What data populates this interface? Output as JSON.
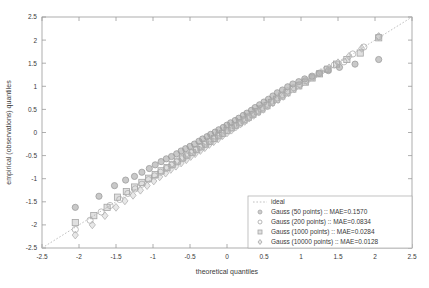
{
  "chart_data": {
    "type": "scatter",
    "title": "",
    "xlabel": "theoretical quantiles",
    "ylabel": "empirical (observations) quantiles",
    "xlim": [
      -2.5,
      2.5
    ],
    "ylim": [
      -2.5,
      2.5
    ],
    "xticks": [
      "-2.5",
      "-2",
      "-1.5",
      "-1",
      "-0.5",
      "0",
      "0.5",
      "1",
      "1.5",
      "2",
      "2.5"
    ],
    "yticks": [
      "-2.5",
      "-2",
      "-1.5",
      "-1",
      "-0.5",
      "0",
      "0.5",
      "1",
      "1.5",
      "2",
      "2.5"
    ],
    "xtick_values": [
      -2.5,
      -2,
      -1.5,
      -1,
      -0.5,
      0,
      0.5,
      1,
      1.5,
      2,
      2.5
    ],
    "ytick_values": [
      -2.5,
      -2,
      -1.5,
      -1,
      -0.5,
      0,
      0.5,
      1,
      1.5,
      2,
      2.5
    ],
    "grid": false,
    "legend_position": "lower-right",
    "reference_line": {
      "name": "ideal",
      "style": "dotted",
      "color": "#b9b9b9",
      "from": [
        -2.5,
        -2.5
      ],
      "to": [
        2.5,
        2.5
      ]
    },
    "series": [
      {
        "name": "Gauss (50 points) :: MAE=0.1570",
        "label": "Gauss (50 points)",
        "mae": "0.1570",
        "marker": "circle",
        "color": "#9d9d9d",
        "points": [
          [
            -2.05,
            -1.62
          ],
          [
            -1.73,
            -1.38
          ],
          [
            -1.52,
            -1.15
          ],
          [
            -1.37,
            -1.03
          ],
          [
            -1.25,
            -0.95
          ],
          [
            -1.15,
            -0.86
          ],
          [
            -1.05,
            -0.78
          ],
          [
            -0.97,
            -0.7
          ],
          [
            -0.89,
            -0.63
          ],
          [
            -0.82,
            -0.57
          ],
          [
            -0.75,
            -0.52
          ],
          [
            -0.68,
            -0.46
          ],
          [
            -0.62,
            -0.4
          ],
          [
            -0.56,
            -0.35
          ],
          [
            -0.5,
            -0.3
          ],
          [
            -0.44,
            -0.25
          ],
          [
            -0.38,
            -0.19
          ],
          [
            -0.33,
            -0.14
          ],
          [
            -0.27,
            -0.09
          ],
          [
            -0.22,
            -0.04
          ],
          [
            -0.16,
            0.01
          ],
          [
            -0.11,
            0.06
          ],
          [
            -0.05,
            0.11
          ],
          [
            0.0,
            0.16
          ],
          [
            0.05,
            0.21
          ],
          [
            0.11,
            0.26
          ],
          [
            0.16,
            0.31
          ],
          [
            0.22,
            0.37
          ],
          [
            0.27,
            0.42
          ],
          [
            0.33,
            0.48
          ],
          [
            0.38,
            0.54
          ],
          [
            0.44,
            0.6
          ],
          [
            0.5,
            0.66
          ],
          [
            0.56,
            0.72
          ],
          [
            0.62,
            0.79
          ],
          [
            0.68,
            0.86
          ],
          [
            0.75,
            0.92
          ],
          [
            0.82,
            0.99
          ],
          [
            0.89,
            1.05
          ],
          [
            0.97,
            1.1
          ],
          [
            1.05,
            1.16
          ],
          [
            1.15,
            1.22
          ],
          [
            1.25,
            1.28
          ],
          [
            1.37,
            1.34
          ],
          [
            1.52,
            1.41
          ],
          [
            1.73,
            1.48
          ],
          [
            2.05,
            1.58
          ]
        ]
      },
      {
        "name": "Gauss (200 points) :: MAE=0.0834",
        "label": "Gauss (200 points)",
        "mae": "0.0834",
        "marker": "circle-open",
        "color": "#aeaeae",
        "points": [
          [
            -2.05,
            -2.1
          ],
          [
            -1.85,
            -1.9
          ],
          [
            -1.7,
            -1.72
          ],
          [
            -1.58,
            -1.58
          ],
          [
            -1.45,
            -1.45
          ],
          [
            -1.34,
            -1.32
          ],
          [
            -1.24,
            -1.22
          ],
          [
            -1.15,
            -1.12
          ],
          [
            -1.06,
            -1.02
          ],
          [
            -0.98,
            -0.94
          ],
          [
            -0.9,
            -0.86
          ],
          [
            -0.82,
            -0.78
          ],
          [
            -0.75,
            -0.71
          ],
          [
            -0.68,
            -0.64
          ],
          [
            -0.61,
            -0.57
          ],
          [
            -0.55,
            -0.51
          ],
          [
            -0.48,
            -0.44
          ],
          [
            -0.42,
            -0.38
          ],
          [
            -0.36,
            -0.32
          ],
          [
            -0.3,
            -0.26
          ],
          [
            -0.24,
            -0.2
          ],
          [
            -0.18,
            -0.14
          ],
          [
            -0.12,
            -0.08
          ],
          [
            -0.06,
            -0.02
          ],
          [
            0.0,
            0.04
          ],
          [
            0.06,
            0.1
          ],
          [
            0.12,
            0.16
          ],
          [
            0.18,
            0.22
          ],
          [
            0.24,
            0.28
          ],
          [
            0.3,
            0.35
          ],
          [
            0.36,
            0.41
          ],
          [
            0.42,
            0.47
          ],
          [
            0.48,
            0.54
          ],
          [
            0.55,
            0.61
          ],
          [
            0.61,
            0.68
          ],
          [
            0.68,
            0.75
          ],
          [
            0.75,
            0.82
          ],
          [
            0.82,
            0.9
          ],
          [
            0.9,
            0.97
          ],
          [
            0.98,
            1.04
          ],
          [
            1.06,
            1.12
          ],
          [
            1.15,
            1.2
          ],
          [
            1.24,
            1.28
          ],
          [
            1.34,
            1.37
          ],
          [
            1.45,
            1.46
          ],
          [
            1.58,
            1.53
          ],
          [
            1.7,
            1.7
          ],
          [
            1.85,
            1.85
          ],
          [
            2.05,
            2.07
          ]
        ]
      },
      {
        "name": "Gauss (1000 points) :: MAE=0.0284",
        "label": "Gauss (1000 points)",
        "mae": "0.0284",
        "marker": "square",
        "color": "#a5a5a5",
        "points": [
          [
            -2.05,
            -1.95
          ],
          [
            -1.8,
            -1.8
          ],
          [
            -1.62,
            -1.62
          ],
          [
            -1.48,
            -1.4
          ],
          [
            -1.36,
            -1.28
          ],
          [
            -1.25,
            -1.18
          ],
          [
            -1.15,
            -1.08
          ],
          [
            -1.06,
            -0.99
          ],
          [
            -0.97,
            -0.91
          ],
          [
            -0.89,
            -0.83
          ],
          [
            -0.81,
            -0.76
          ],
          [
            -0.74,
            -0.69
          ],
          [
            -0.67,
            -0.62
          ],
          [
            -0.6,
            -0.55
          ],
          [
            -0.54,
            -0.49
          ],
          [
            -0.47,
            -0.43
          ],
          [
            -0.41,
            -0.37
          ],
          [
            -0.35,
            -0.31
          ],
          [
            -0.29,
            -0.25
          ],
          [
            -0.23,
            -0.19
          ],
          [
            -0.17,
            -0.13
          ],
          [
            -0.11,
            -0.07
          ],
          [
            -0.06,
            -0.02
          ],
          [
            0.0,
            0.04
          ],
          [
            0.06,
            0.1
          ],
          [
            0.11,
            0.15
          ],
          [
            0.17,
            0.21
          ],
          [
            0.23,
            0.27
          ],
          [
            0.29,
            0.33
          ],
          [
            0.35,
            0.39
          ],
          [
            0.41,
            0.45
          ],
          [
            0.47,
            0.51
          ],
          [
            0.54,
            0.58
          ],
          [
            0.6,
            0.65
          ],
          [
            0.67,
            0.72
          ],
          [
            0.74,
            0.79
          ],
          [
            0.81,
            0.86
          ],
          [
            0.89,
            0.94
          ],
          [
            0.97,
            1.01
          ],
          [
            1.06,
            1.09
          ],
          [
            1.15,
            1.18
          ],
          [
            1.25,
            1.27
          ],
          [
            1.36,
            1.37
          ],
          [
            1.48,
            1.48
          ],
          [
            1.62,
            1.58
          ],
          [
            1.8,
            1.72
          ],
          [
            2.05,
            2.05
          ]
        ]
      },
      {
        "name": "Gauss (10000 points) :: MAE=0.0128",
        "label": "Gauss (10000 points)",
        "mae": "0.0128",
        "marker": "diamond",
        "color": "#b3b3b3",
        "points": [
          [
            -2.05,
            -2.22
          ],
          [
            -1.82,
            -2.0
          ],
          [
            -1.65,
            -1.8
          ],
          [
            -1.5,
            -1.62
          ],
          [
            -1.38,
            -1.48
          ],
          [
            -1.27,
            -1.36
          ],
          [
            -1.17,
            -1.25
          ],
          [
            -1.08,
            -1.15
          ],
          [
            -0.99,
            -1.05
          ],
          [
            -0.91,
            -0.96
          ],
          [
            -0.83,
            -0.88
          ],
          [
            -0.76,
            -0.8
          ],
          [
            -0.69,
            -0.73
          ],
          [
            -0.62,
            -0.66
          ],
          [
            -0.55,
            -0.59
          ],
          [
            -0.49,
            -0.52
          ],
          [
            -0.43,
            -0.46
          ],
          [
            -0.36,
            -0.39
          ],
          [
            -0.3,
            -0.33
          ],
          [
            -0.24,
            -0.26
          ],
          [
            -0.18,
            -0.2
          ],
          [
            -0.12,
            -0.14
          ],
          [
            -0.06,
            -0.07
          ],
          [
            0.0,
            -0.01
          ],
          [
            0.06,
            0.05
          ],
          [
            0.12,
            0.12
          ],
          [
            0.18,
            0.18
          ],
          [
            0.24,
            0.24
          ],
          [
            0.3,
            0.31
          ],
          [
            0.36,
            0.37
          ],
          [
            0.43,
            0.44
          ],
          [
            0.49,
            0.5
          ],
          [
            0.55,
            0.57
          ],
          [
            0.62,
            0.64
          ],
          [
            0.69,
            0.71
          ],
          [
            0.76,
            0.78
          ],
          [
            0.83,
            0.86
          ],
          [
            0.91,
            0.94
          ],
          [
            0.99,
            1.02
          ],
          [
            1.08,
            1.11
          ],
          [
            1.17,
            1.2
          ],
          [
            1.27,
            1.3
          ],
          [
            1.38,
            1.4
          ],
          [
            1.5,
            1.51
          ],
          [
            1.65,
            1.65
          ],
          [
            1.82,
            1.82
          ],
          [
            2.05,
            2.08
          ]
        ]
      }
    ]
  },
  "legend": {
    "entries": [
      {
        "label": "ideal",
        "marker": "line-dotted"
      },
      {
        "label": "Gauss (50 points) :: MAE=0.1570",
        "marker": "circle"
      },
      {
        "label": "Gauss (200 points) :: MAE=0.0834",
        "marker": "circle-open"
      },
      {
        "label": "Gauss (1000 points) :: MAE=0.0284",
        "marker": "square"
      },
      {
        "label": "Gauss (10000 points) :: MAE=0.0128",
        "marker": "diamond"
      }
    ]
  }
}
